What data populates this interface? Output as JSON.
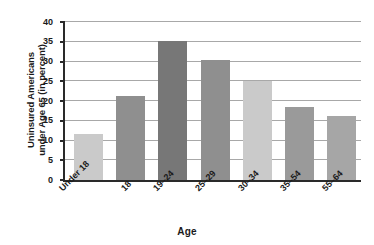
{
  "chart_data": {
    "type": "bar",
    "title": "",
    "xlabel": "Age",
    "ylabel": "Uninsured Americans under Age 65 (in percent)",
    "ylabel_line1": "Uninsured Americans",
    "ylabel_line2": "under Age 65 (in percent)",
    "categories": [
      "Under 18",
      "18",
      "19–24",
      "25–29",
      "30–34",
      "35–54",
      "55–64"
    ],
    "values": [
      11.7,
      21.2,
      35.2,
      30.3,
      25.1,
      18.6,
      16.1
    ],
    "ylim": [
      0,
      40
    ],
    "ytick_values": [
      0,
      5,
      10,
      15,
      20,
      25,
      30,
      35,
      40
    ],
    "ytick_labels": [
      "0",
      "5",
      "10",
      "15",
      "20",
      "25",
      "30",
      "35",
      "40"
    ],
    "grid": true,
    "grid_axis": "y",
    "legend": false,
    "legend_position": "none",
    "bar_colors": [
      "#cacaca",
      "#8f8f8f",
      "#777777",
      "#8f8f8f",
      "#cacaca",
      "#9a9a9a",
      "#a6a6a6"
    ],
    "axis_color": "#2a2a2a",
    "grid_color": "#a8a8a8",
    "background_color": "#ffffff"
  }
}
